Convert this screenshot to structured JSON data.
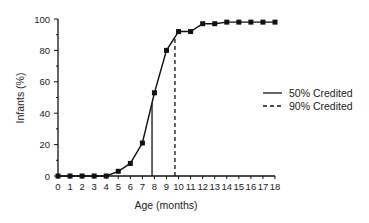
{
  "chart_data": {
    "type": "line",
    "title": "",
    "xlabel": "Age  (months)",
    "ylabel": "Infants  (%)",
    "x": [
      0,
      1,
      2,
      3,
      4,
      5,
      6,
      7,
      8,
      9,
      10,
      11,
      12,
      13,
      14,
      15,
      16,
      17,
      18
    ],
    "series": [
      {
        "name": "Infants credited (%)",
        "values": [
          0,
          0,
          0,
          0,
          0,
          3,
          8,
          21,
          53,
          80,
          92,
          92,
          97,
          97,
          98,
          98,
          98,
          98,
          98
        ],
        "marker": "square"
      }
    ],
    "reference_lines": [
      {
        "name": "50% Credited",
        "x": 7.8,
        "style": "solid"
      },
      {
        "name": "90% Credited",
        "x": 9.7,
        "style": "dashed"
      }
    ],
    "xlim": [
      0,
      18
    ],
    "ylim": [
      0,
      100
    ],
    "xticks": [
      0,
      1,
      2,
      3,
      4,
      5,
      6,
      7,
      8,
      9,
      10,
      11,
      12,
      13,
      14,
      15,
      16,
      17,
      18
    ],
    "yticks": [
      0,
      20,
      40,
      60,
      80,
      100
    ],
    "grid": false,
    "legend_position": "right",
    "legend": [
      {
        "label": "50% Credited",
        "style": "solid"
      },
      {
        "label": "90% Credited",
        "style": "dashed"
      }
    ]
  }
}
